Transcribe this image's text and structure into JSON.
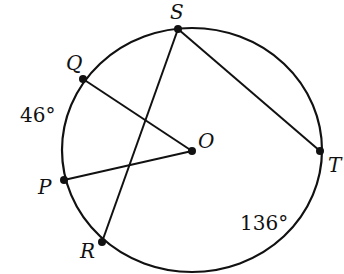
{
  "diagram": {
    "type": "circle-geometry",
    "center_label": "O",
    "points": {
      "S": {
        "label": "S",
        "x": 178,
        "y": 29
      },
      "Q": {
        "label": "Q",
        "x": 83,
        "y": 79
      },
      "P": {
        "label": "P",
        "x": 64,
        "y": 180
      },
      "R": {
        "label": "R",
        "x": 102,
        "y": 242
      },
      "T": {
        "label": "T",
        "x": 320,
        "y": 151
      },
      "O": {
        "label": "O",
        "x": 192,
        "y": 151
      }
    },
    "segments": [
      "QO",
      "PO",
      "SR",
      "ST"
    ],
    "arc_labels": {
      "PQ": "46°",
      "RT": "136°"
    },
    "colors": {
      "stroke": "#111111",
      "background": "#ffffff"
    }
  }
}
